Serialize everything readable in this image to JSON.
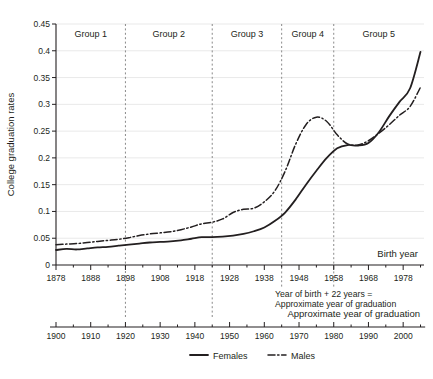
{
  "chart_data": {
    "type": "line",
    "title": "",
    "xlabel": "Birth year",
    "ylabel": "College graduation rates",
    "secondary_xlabel": "Approximate year of graduation",
    "annotation_line1": "Year of birth + 22 years =",
    "annotation_line2": "Approximate year of graduation",
    "xlim": [
      1878,
      1984
    ],
    "ylim": [
      0,
      0.45
    ],
    "ytick_labels": [
      "0",
      "0.05",
      "0.1",
      "0.15",
      "0.2",
      "0.25",
      "0.3",
      "0.35",
      "0.4",
      "0.45"
    ],
    "ytick_values": [
      0,
      0.05,
      0.1,
      0.15,
      0.2,
      0.25,
      0.3,
      0.35,
      0.4,
      0.45
    ],
    "xtick_labels": [
      "1878",
      "1888",
      "1898",
      "1908",
      "1918",
      "1928",
      "1938",
      "1948",
      "1958",
      "1968",
      "1978"
    ],
    "xtick_values": [
      1878,
      1888,
      1898,
      1908,
      1918,
      1928,
      1938,
      1948,
      1958,
      1968,
      1978
    ],
    "secondary_xtick_labels": [
      "1900",
      "1910",
      "1920",
      "1930",
      "1940",
      "1950",
      "1960",
      "1970",
      "1980",
      "1990",
      "2000"
    ],
    "secondary_xtick_values": [
      1900,
      1910,
      1920,
      1930,
      1940,
      1950,
      1960,
      1970,
      1980,
      1990,
      2000
    ],
    "grid": true,
    "legend_position": "bottom",
    "group_dividers": [
      1898,
      1923,
      1943,
      1958
    ],
    "groups": [
      {
        "label": "Group 1",
        "start": 1878,
        "end": 1898
      },
      {
        "label": "Group 2",
        "start": 1898,
        "end": 1923
      },
      {
        "label": "Group 3",
        "start": 1923,
        "end": 1943
      },
      {
        "label": "Group 4",
        "start": 1943,
        "end": 1958
      },
      {
        "label": "Group 5",
        "start": 1958,
        "end": 1984
      }
    ],
    "series": [
      {
        "name": "Females",
        "style": "solid",
        "color": "#231f20",
        "x": [
          1878,
          1881,
          1884,
          1887,
          1890,
          1893,
          1896,
          1899,
          1902,
          1905,
          1908,
          1911,
          1914,
          1917,
          1920,
          1923,
          1926,
          1929,
          1932,
          1935,
          1938,
          1941,
          1944,
          1947,
          1950,
          1953,
          1956,
          1959,
          1962,
          1965,
          1968,
          1971,
          1974,
          1977,
          1980,
          1983
        ],
        "values": [
          0.028,
          0.03,
          0.029,
          0.031,
          0.033,
          0.034,
          0.036,
          0.038,
          0.04,
          0.042,
          0.043,
          0.044,
          0.046,
          0.049,
          0.052,
          0.052,
          0.053,
          0.055,
          0.058,
          0.063,
          0.07,
          0.082,
          0.098,
          0.122,
          0.15,
          0.176,
          0.2,
          0.218,
          0.224,
          0.223,
          0.228,
          0.248,
          0.278,
          0.305,
          0.33,
          0.398
        ]
      },
      {
        "name": "Males",
        "style": "dash-dot",
        "color": "#231f20",
        "x": [
          1878,
          1881,
          1884,
          1887,
          1890,
          1893,
          1896,
          1899,
          1902,
          1905,
          1908,
          1911,
          1914,
          1917,
          1920,
          1923,
          1926,
          1929,
          1932,
          1935,
          1938,
          1941,
          1944,
          1947,
          1950,
          1953,
          1956,
          1959,
          1962,
          1965,
          1968,
          1971,
          1974,
          1977,
          1980,
          1983
        ],
        "values": [
          0.038,
          0.039,
          0.04,
          0.042,
          0.044,
          0.046,
          0.048,
          0.051,
          0.055,
          0.058,
          0.06,
          0.062,
          0.066,
          0.071,
          0.077,
          0.08,
          0.086,
          0.098,
          0.104,
          0.106,
          0.118,
          0.138,
          0.175,
          0.225,
          0.262,
          0.276,
          0.268,
          0.243,
          0.226,
          0.224,
          0.232,
          0.246,
          0.262,
          0.28,
          0.296,
          0.332
        ]
      }
    ]
  },
  "legend": {
    "items": [
      {
        "label": "Females",
        "style": "solid"
      },
      {
        "label": "Males",
        "style": "dash-dot"
      }
    ]
  }
}
